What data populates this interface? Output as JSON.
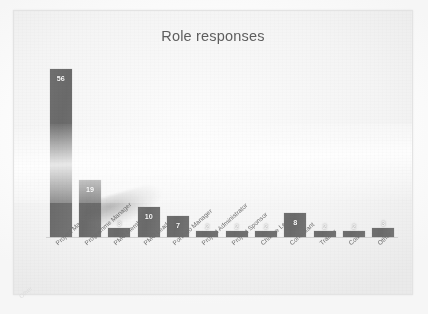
{
  "chart_data": {
    "type": "bar",
    "title": "Role responses",
    "xlabel": "",
    "ylabel": "Number of respondents",
    "ylim": [
      0,
      60
    ],
    "grid": false,
    "legend": null,
    "categories": [
      "Project Manager",
      "Programme Manager",
      "PMO Member",
      "PMO Leader",
      "Portfolio Manager",
      "Project Administrator",
      "Project Sponsor",
      "Change Leader",
      "Consultant",
      "Trainer",
      "Coach",
      "Other"
    ],
    "values": [
      56,
      19,
      3,
      10,
      7,
      2,
      2,
      2,
      8,
      2,
      2,
      3
    ],
    "bar_color": "#6f6f6f",
    "label_color": "#ffffff"
  },
  "chart": {
    "title": "Role responses",
    "y_axis_title": "Number of respondents",
    "bars": [
      {
        "category": "Project Manager",
        "value": 56,
        "label": "56"
      },
      {
        "category": "Programme Manager",
        "value": 19,
        "label": "19"
      },
      {
        "category": "PMO Member",
        "value": 3,
        "label": "3"
      },
      {
        "category": "PMO Leader",
        "value": 10,
        "label": "10"
      },
      {
        "category": "Portfolio Manager",
        "value": 7,
        "label": "7"
      },
      {
        "category": "Project Administrator",
        "value": 2,
        "label": "2"
      },
      {
        "category": "Project Sponsor",
        "value": 2,
        "label": "2"
      },
      {
        "category": "Change Leader",
        "value": 2,
        "label": "2"
      },
      {
        "category": "Consultant",
        "value": 8,
        "label": "8"
      },
      {
        "category": "Trainer",
        "value": 2,
        "label": "2"
      },
      {
        "category": "Coach",
        "value": 2,
        "label": "2"
      },
      {
        "category": "Other",
        "value": 3,
        "label": "3"
      }
    ]
  },
  "page": {
    "artifact_text": "Other"
  }
}
